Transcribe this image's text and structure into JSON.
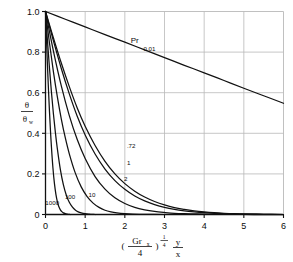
{
  "chart_data": {
    "type": "line",
    "title": "",
    "xlabel": "(Gr_x/4)^(1/4) y/x",
    "ylabel": "theta / theta_w",
    "xlim": [
      0,
      6
    ],
    "ylim": [
      0,
      1.0
    ],
    "grid": true,
    "legend_position": "inline-curve-labels",
    "x_ticks": [
      "0",
      "1",
      "2",
      "3",
      "4",
      "5",
      "6"
    ],
    "x_tick_values": [
      0,
      1,
      2,
      3,
      4,
      5,
      6
    ],
    "y_ticks": [
      "0",
      "0.2",
      "0.4",
      "0.6",
      "0.8",
      "1.0"
    ],
    "y_tick_values": [
      0,
      0.2,
      0.4,
      0.6,
      0.8,
      1.0
    ],
    "series_parameter_name": "Pr",
    "series": [
      {
        "name": "0.01",
        "label": "0.01",
        "x": [
          0,
          0.5,
          1,
          1.5,
          2,
          2.5,
          3,
          3.5,
          4,
          4.5,
          5,
          5.5,
          6
        ],
        "values": [
          1.0,
          0.962,
          0.924,
          0.886,
          0.849,
          0.811,
          0.773,
          0.735,
          0.698,
          0.66,
          0.622,
          0.585,
          0.548
        ]
      },
      {
        "name": "0.72",
        "label": ".72",
        "x": [
          0,
          0.2,
          0.4,
          0.6,
          0.8,
          1.0,
          1.25,
          1.5,
          1.75,
          2.0,
          2.25,
          2.5,
          2.75,
          3.0,
          3.25,
          3.5,
          3.75,
          4.0,
          4.25,
          4.5,
          4.75,
          5.0,
          5.5,
          6.0
        ],
        "values": [
          1.0,
          0.87,
          0.745,
          0.63,
          0.525,
          0.435,
          0.34,
          0.262,
          0.2,
          0.152,
          0.115,
          0.086,
          0.064,
          0.047,
          0.034,
          0.025,
          0.018,
          0.013,
          0.009,
          0.006,
          0.004,
          0.003,
          0.001,
          0.0
        ]
      },
      {
        "name": "1",
        "label": "1",
        "x": [
          0,
          0.2,
          0.4,
          0.6,
          0.8,
          1.0,
          1.25,
          1.5,
          1.75,
          2.0,
          2.25,
          2.5,
          2.75,
          3.0,
          3.25,
          3.5,
          3.75,
          4.0,
          4.25,
          4.5,
          4.75,
          5.0,
          5.5,
          6.0
        ],
        "values": [
          1.0,
          0.855,
          0.718,
          0.594,
          0.484,
          0.392,
          0.298,
          0.224,
          0.167,
          0.124,
          0.091,
          0.067,
          0.049,
          0.035,
          0.025,
          0.018,
          0.013,
          0.009,
          0.006,
          0.004,
          0.003,
          0.002,
          0.001,
          0.0
        ]
      },
      {
        "name": "2",
        "label": "2",
        "x": [
          0,
          0.2,
          0.4,
          0.6,
          0.8,
          1.0,
          1.25,
          1.5,
          1.75,
          2.0,
          2.25,
          2.5,
          2.75,
          3.0,
          3.25,
          3.5,
          3.75,
          4.0,
          4.5,
          5.0,
          5.5,
          6.0
        ],
        "values": [
          1.0,
          0.805,
          0.632,
          0.487,
          0.369,
          0.276,
          0.187,
          0.125,
          0.082,
          0.054,
          0.035,
          0.023,
          0.015,
          0.01,
          0.006,
          0.004,
          0.003,
          0.002,
          0.001,
          0.0,
          0.0,
          0.0
        ]
      },
      {
        "name": "10",
        "label": "10",
        "x": [
          0,
          0.1,
          0.2,
          0.3,
          0.4,
          0.5,
          0.6,
          0.75,
          0.9,
          1.05,
          1.2,
          1.35,
          1.5,
          1.65,
          1.8,
          2.0,
          2.2,
          2.5,
          3.0
        ],
        "values": [
          1.0,
          0.845,
          0.703,
          0.578,
          0.469,
          0.377,
          0.299,
          0.205,
          0.136,
          0.088,
          0.056,
          0.035,
          0.021,
          0.013,
          0.008,
          0.004,
          0.002,
          0.001,
          0.0
        ]
      },
      {
        "name": "100",
        "label": "100",
        "x": [
          0,
          0.05,
          0.1,
          0.15,
          0.2,
          0.25,
          0.3,
          0.375,
          0.45,
          0.525,
          0.6,
          0.675,
          0.75,
          0.825,
          0.9,
          1.0,
          1.1,
          1.25
        ],
        "values": [
          1.0,
          0.855,
          0.722,
          0.602,
          0.495,
          0.402,
          0.322,
          0.221,
          0.147,
          0.095,
          0.06,
          0.037,
          0.022,
          0.013,
          0.008,
          0.004,
          0.002,
          0.0
        ]
      },
      {
        "name": "1000",
        "label": "1000",
        "x": [
          0,
          0.025,
          0.05,
          0.075,
          0.1,
          0.125,
          0.15,
          0.1875,
          0.225,
          0.2625,
          0.3,
          0.3375,
          0.375,
          0.4125,
          0.45,
          0.5,
          0.55,
          0.625
        ],
        "values": [
          1.0,
          0.862,
          0.733,
          0.615,
          0.508,
          0.414,
          0.332,
          0.229,
          0.153,
          0.099,
          0.062,
          0.038,
          0.023,
          0.014,
          0.008,
          0.004,
          0.002,
          0.0
        ]
      }
    ],
    "annotations": [
      {
        "text": "Pr",
        "x": 2.25,
        "y": 0.855
      },
      {
        "text": "0.01",
        "x": 2.62,
        "y": 0.815
      }
    ],
    "colors": {
      "curve": "#111111",
      "axis": "#111111",
      "grid": "#b9b9b9",
      "background": "#ffffff"
    }
  },
  "axis_labels": {
    "y_numerator": "θ",
    "y_denominator": "θ",
    "y_denominator_sub": "w",
    "x_paren_open": "(",
    "x_gr": "Gr",
    "x_gr_sub": "x",
    "x_over": "4",
    "x_paren_close": ")",
    "x_exp_num": "1",
    "x_exp_den": "4",
    "x_frac_num": "y",
    "x_frac_den": "x"
  }
}
